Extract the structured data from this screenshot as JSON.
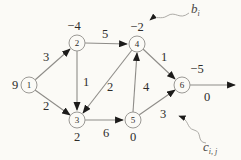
{
  "figure": {
    "type": "network-flow-diagram",
    "colors": {
      "background": "#fbfaf6",
      "edge_line": "#8e8c88",
      "arrowhead": "#1c1b1a",
      "node_stroke": "#9b9995",
      "text": "#2e2c2a",
      "annotation_line": "#a5a39e"
    },
    "nodes": [
      {
        "id": "1",
        "value": "9",
        "value_position": "left"
      },
      {
        "id": "2",
        "value": "−4",
        "value_position": "above"
      },
      {
        "id": "3",
        "value": "2",
        "value_position": "below"
      },
      {
        "id": "4",
        "value": "−2",
        "value_position": "above"
      },
      {
        "id": "5",
        "value": "0",
        "value_position": "below"
      },
      {
        "id": "6",
        "value": "−5",
        "value_position": "above"
      }
    ],
    "edges": [
      {
        "from": "1",
        "to": "2",
        "cost": "3"
      },
      {
        "from": "1",
        "to": "3",
        "cost": "2"
      },
      {
        "from": "2",
        "to": "4",
        "cost": "5"
      },
      {
        "from": "2",
        "to": "3",
        "cost": "1"
      },
      {
        "from": "4",
        "to": "3",
        "cost": "2"
      },
      {
        "from": "5",
        "to": "4",
        "cost": "4"
      },
      {
        "from": "4",
        "to": "6",
        "cost": "1"
      },
      {
        "from": "3",
        "to": "5",
        "cost": "6"
      },
      {
        "from": "5",
        "to": "6",
        "cost": "3"
      },
      {
        "from": "6",
        "to": "sink",
        "cost": "0"
      }
    ],
    "annotations": {
      "b_main": "b",
      "b_sub": "i",
      "c_main": "c",
      "c_sub": "i, j"
    }
  }
}
